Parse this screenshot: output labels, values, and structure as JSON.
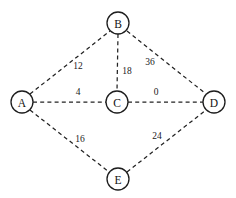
{
  "diagram": {
    "type": "node-link-graph",
    "background_color": "#ffffff",
    "stroke_color": "#232323",
    "node_fill_color": "#ffffff",
    "edge_style": "dashed",
    "nodes": [
      {
        "id": "A",
        "label": "A",
        "x": 22,
        "y": 102,
        "r": 11
      },
      {
        "id": "B",
        "label": "B",
        "x": 118,
        "y": 23,
        "r": 11
      },
      {
        "id": "C",
        "label": "C",
        "x": 117,
        "y": 102,
        "r": 11
      },
      {
        "id": "D",
        "label": "D",
        "x": 214,
        "y": 102,
        "r": 11
      },
      {
        "id": "E",
        "label": "E",
        "x": 118,
        "y": 179,
        "r": 11
      }
    ],
    "edges": [
      {
        "from": "A",
        "to": "B",
        "weight": "12",
        "label_x": 78,
        "label_y": 66,
        "x1": 30,
        "y1": 94,
        "x2": 110,
        "y2": 31
      },
      {
        "from": "B",
        "to": "C",
        "weight": "18",
        "label_x": 127,
        "label_y": 71,
        "x1": 118,
        "y1": 34,
        "x2": 117,
        "y2": 91
      },
      {
        "from": "B",
        "to": "D",
        "weight": "36",
        "label_x": 150,
        "label_y": 62,
        "x1": 127,
        "y1": 31,
        "x2": 206,
        "y2": 94
      },
      {
        "from": "A",
        "to": "C",
        "weight": "4",
        "label_x": 78,
        "label_y": 92,
        "x1": 33,
        "y1": 102,
        "x2": 106,
        "y2": 102
      },
      {
        "from": "C",
        "to": "D",
        "weight": "0",
        "label_x": 156,
        "label_y": 92,
        "x1": 128,
        "y1": 102,
        "x2": 203,
        "y2": 102
      },
      {
        "from": "A",
        "to": "E",
        "weight": "16",
        "label_x": 80,
        "label_y": 139,
        "x1": 30,
        "y1": 110,
        "x2": 109,
        "y2": 172
      },
      {
        "from": "E",
        "to": "D",
        "weight": "24",
        "label_x": 157,
        "label_y": 136,
        "x1": 127,
        "y1": 172,
        "x2": 206,
        "y2": 110
      }
    ]
  }
}
